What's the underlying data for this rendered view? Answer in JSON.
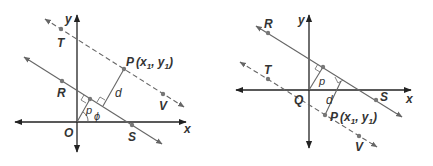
{
  "colors": {
    "axis": "#222222",
    "line": "#666666",
    "point": "#777777",
    "text": "#333333"
  },
  "figures": [
    {
      "id": "left",
      "labels": {
        "x_axis": "x",
        "y_axis": "y",
        "origin": "O",
        "R": "R",
        "S": "S",
        "T": "T",
        "V": "V",
        "P": "P",
        "P_coords": "(x",
        "P_sub1": "1",
        "P_comma": ", y",
        "P_sub2": "1",
        "P_close": ")",
        "d": "d",
        "p": "p",
        "phi": "ϕ"
      }
    },
    {
      "id": "right",
      "labels": {
        "x_axis": "x",
        "y_axis": "y",
        "origin": "Q",
        "R": "R",
        "S": "S",
        "T": "T",
        "V": "V",
        "P": "P",
        "P_coords": "(x",
        "P_sub1": "1",
        "P_comma": ", y",
        "P_sub2": "1",
        "P_close": ")",
        "d": "d",
        "p": "p"
      }
    }
  ]
}
